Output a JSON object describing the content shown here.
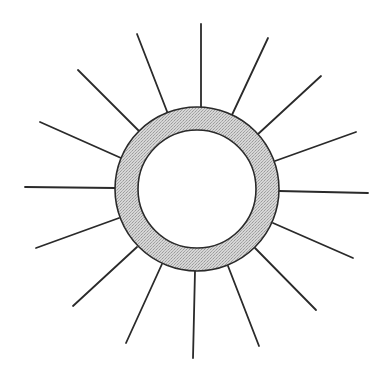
{
  "diagram": {
    "colors": {
      "background": "#ffffff",
      "stroke": "#2a2a2a",
      "ring_fill": "#cfcfcf",
      "inner_fill": "#ffffff"
    },
    "ring": {
      "cx": 197,
      "cy": 189,
      "outer_r": 82,
      "inner_r": 59
    },
    "rays": [
      {
        "x1": 201,
        "y1": 108,
        "x2": 201,
        "y2": 24
      },
      {
        "x1": 231,
        "y1": 117,
        "x2": 268,
        "y2": 38
      },
      {
        "x1": 257,
        "y1": 135,
        "x2": 321,
        "y2": 76
      },
      {
        "x1": 275,
        "y1": 161,
        "x2": 356,
        "y2": 132
      },
      {
        "x1": 279,
        "y1": 191,
        "x2": 368,
        "y2": 193
      },
      {
        "x1": 273,
        "y1": 223,
        "x2": 353,
        "y2": 258
      },
      {
        "x1": 255,
        "y1": 248,
        "x2": 316,
        "y2": 310
      },
      {
        "x1": 228,
        "y1": 266,
        "x2": 259,
        "y2": 346
      },
      {
        "x1": 195,
        "y1": 271,
        "x2": 193,
        "y2": 358
      },
      {
        "x1": 162,
        "y1": 264,
        "x2": 126,
        "y2": 343
      },
      {
        "x1": 137,
        "y1": 247,
        "x2": 73,
        "y2": 306
      },
      {
        "x1": 119,
        "y1": 218,
        "x2": 36,
        "y2": 248
      },
      {
        "x1": 115,
        "y1": 188,
        "x2": 25,
        "y2": 187
      },
      {
        "x1": 121,
        "y1": 158,
        "x2": 40,
        "y2": 122
      },
      {
        "x1": 140,
        "y1": 132,
        "x2": 78,
        "y2": 70
      },
      {
        "x1": 168,
        "y1": 114,
        "x2": 137,
        "y2": 34
      }
    ]
  }
}
